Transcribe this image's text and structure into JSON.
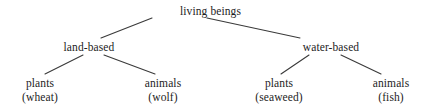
{
  "diagram": {
    "type": "hierarchy-tree",
    "background_color": "#ffffff",
    "text_color": "#1d1d1d",
    "edge_color": "#3a3a3a",
    "root": {
      "label": "living beings"
    },
    "level2": [
      {
        "label": "land-based"
      },
      {
        "label": "water-based"
      }
    ],
    "leaves": [
      {
        "label": "plants",
        "example": "(wheat)"
      },
      {
        "label": "animals",
        "example": "(wolf)"
      },
      {
        "label": "plants",
        "example": "(seaweed)"
      },
      {
        "label": "animals",
        "example": "(fish)"
      }
    ],
    "edges": [
      {
        "name": "root-to-land-based",
        "x1": 152,
        "y1": 18,
        "x2": 101,
        "y2": 38
      },
      {
        "name": "root-to-water-based",
        "x1": 207,
        "y1": 18,
        "x2": 300,
        "y2": 38
      },
      {
        "name": "land-based-to-plants",
        "x1": 83,
        "y1": 55,
        "x2": 45,
        "y2": 74
      },
      {
        "name": "land-based-to-animals",
        "x1": 104,
        "y1": 55,
        "x2": 155,
        "y2": 74
      },
      {
        "name": "water-based-to-plants",
        "x1": 309,
        "y1": 55,
        "x2": 281,
        "y2": 74
      },
      {
        "name": "water-based-to-animals",
        "x1": 341,
        "y1": 55,
        "x2": 381,
        "y2": 74
      }
    ]
  }
}
